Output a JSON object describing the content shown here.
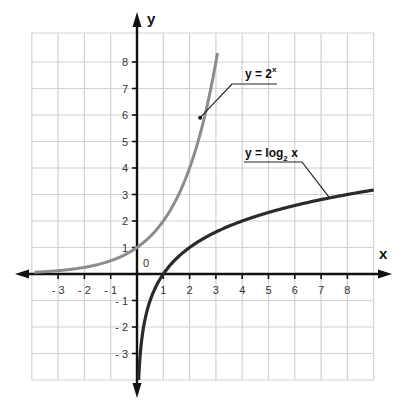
{
  "chart_data": {
    "type": "line",
    "title": "",
    "xlabel": "x",
    "ylabel": "y",
    "xlim": [
      -4,
      9
    ],
    "ylim": [
      -4,
      9
    ],
    "grid": true,
    "origin_label": "0",
    "x_ticks": [
      -3,
      -2,
      -1,
      1,
      2,
      3,
      4,
      5,
      6,
      7,
      8
    ],
    "y_ticks": [
      -3,
      -2,
      -1,
      1,
      2,
      3,
      4,
      5,
      6,
      7,
      8
    ],
    "x_tick_labels": [
      "- 3",
      "- 2",
      "- 1",
      "1",
      "2",
      "3",
      "4",
      "5",
      "6",
      "7",
      "8"
    ],
    "y_tick_labels": [
      "- 3",
      "- 2",
      "- 1",
      "1",
      "2",
      "3",
      "4",
      "5",
      "6",
      "7",
      "8"
    ],
    "series": [
      {
        "name": "y = 2^x",
        "label_main": "y = 2",
        "label_sup": "x",
        "color": "#8c8c8c",
        "function": "2^x",
        "x": [
          -4,
          -3,
          -2,
          -1,
          0,
          1,
          2,
          2.5,
          3.06
        ],
        "values": [
          0.0625,
          0.125,
          0.25,
          0.5,
          1,
          2,
          4,
          5.66,
          8.34
        ],
        "annotation_point": [
          2.4,
          5.9
        ]
      },
      {
        "name": "y = log2 x",
        "label_main": "y = log",
        "label_sub": "2",
        "label_tail": " x",
        "color": "#2a2a2a",
        "function": "log2(x)",
        "x": [
          0.0625,
          0.125,
          0.25,
          0.5,
          1,
          2,
          4,
          8,
          9
        ],
        "values": [
          -4,
          -3,
          -2,
          -1,
          0,
          1,
          2,
          3,
          3.17
        ],
        "annotation_point": [
          7.3,
          2.9
        ]
      }
    ]
  }
}
